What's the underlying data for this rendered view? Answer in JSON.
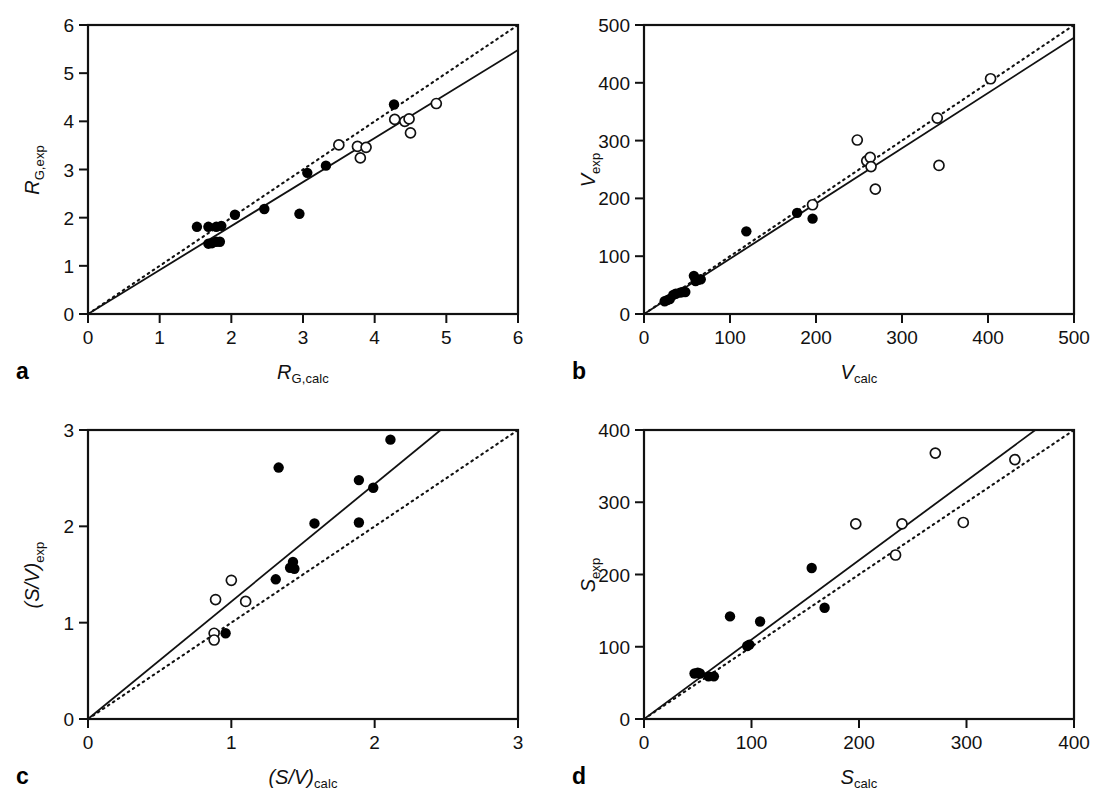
{
  "figure": {
    "background": "#ffffff",
    "marker_fill_color": "#000000",
    "marker_open_color": "#ffffff",
    "line_color": "#000000"
  },
  "panels": [
    {
      "letter": "a",
      "xlabel_main": "R",
      "xlabel_sub": "G,calc",
      "ylabel_main": "R",
      "ylabel_sub": "G,exp",
      "xticks": [
        "0",
        "1",
        "2",
        "3",
        "4",
        "5",
        "6"
      ],
      "yticks": [
        "0",
        "1",
        "2",
        "3",
        "4",
        "5",
        "6"
      ]
    },
    {
      "letter": "b",
      "xlabel_main": "V",
      "xlabel_sub": "calc",
      "ylabel_main": "V",
      "ylabel_sub": "exp",
      "xticks": [
        "0",
        "100",
        "200",
        "300",
        "400",
        "500"
      ],
      "yticks": [
        "0",
        "100",
        "200",
        "300",
        "400",
        "500"
      ]
    },
    {
      "letter": "c",
      "xlabel_main": "(S/V)",
      "xlabel_sub": "calc",
      "ylabel_main": "(S/V)",
      "ylabel_sub": "exp",
      "xticks": [
        "0",
        "1",
        "2",
        "3"
      ],
      "yticks": [
        "0",
        "1",
        "2",
        "3"
      ]
    },
    {
      "letter": "d",
      "xlabel_main": "S",
      "xlabel_sub": "calc",
      "ylabel_main": "S",
      "ylabel_sub": "exp",
      "xticks": [
        "0",
        "100",
        "200",
        "300",
        "400"
      ],
      "yticks": [
        "0",
        "100",
        "200",
        "300",
        "400"
      ]
    }
  ],
  "chart_data": [
    {
      "type": "scatter",
      "panel": "a",
      "title": "",
      "xlabel": "R_G,calc",
      "ylabel": "R_G,exp",
      "xlim": [
        0,
        6
      ],
      "ylim": [
        0,
        6
      ],
      "xticks": [
        0,
        1,
        2,
        3,
        4,
        5,
        6
      ],
      "yticks": [
        0,
        1,
        2,
        3,
        4,
        5,
        6
      ],
      "grid": false,
      "legend": "none",
      "series": [
        {
          "name": "filled-circles",
          "marker": "filled-circle",
          "points": [
            [
              1.52,
              1.81
            ],
            [
              1.68,
              1.81
            ],
            [
              1.79,
              1.81
            ],
            [
              1.86,
              1.83
            ],
            [
              1.68,
              1.46
            ],
            [
              1.73,
              1.47
            ],
            [
              1.79,
              1.5
            ],
            [
              1.84,
              1.5
            ],
            [
              2.05,
              2.06
            ],
            [
              2.46,
              2.18
            ],
            [
              2.95,
              2.08
            ],
            [
              3.06,
              2.93
            ],
            [
              3.32,
              3.08
            ],
            [
              4.27,
              4.35
            ]
          ]
        },
        {
          "name": "open-circles",
          "marker": "open-circle",
          "points": [
            [
              3.5,
              3.51
            ],
            [
              3.76,
              3.48
            ],
            [
              3.88,
              3.46
            ],
            [
              3.8,
              3.24
            ],
            [
              4.28,
              4.04
            ],
            [
              4.42,
              4.0
            ],
            [
              4.48,
              4.05
            ],
            [
              4.5,
              3.76
            ],
            [
              4.86,
              4.37
            ]
          ]
        }
      ],
      "lines": [
        {
          "name": "identity-line",
          "style": "dotted",
          "from": [
            0,
            0
          ],
          "to": [
            6,
            6
          ]
        },
        {
          "name": "regression-line",
          "style": "solid",
          "from": [
            0,
            0
          ],
          "to": [
            6,
            5.48
          ]
        }
      ]
    },
    {
      "type": "scatter",
      "panel": "b",
      "title": "",
      "xlabel": "V_calc",
      "ylabel": "V_exp",
      "xlim": [
        0,
        500
      ],
      "ylim": [
        0,
        500
      ],
      "xticks": [
        0,
        100,
        200,
        300,
        400,
        500
      ],
      "yticks": [
        0,
        100,
        200,
        300,
        400,
        500
      ],
      "grid": false,
      "legend": "none",
      "series": [
        {
          "name": "filled-circles",
          "marker": "filled-circle",
          "points": [
            [
              24,
              22
            ],
            [
              27,
              24
            ],
            [
              30,
              26
            ],
            [
              34,
              33
            ],
            [
              37,
              35
            ],
            [
              42,
              37
            ],
            [
              45,
              38
            ],
            [
              48,
              38
            ],
            [
              58,
              66
            ],
            [
              60,
              57
            ],
            [
              63,
              59
            ],
            [
              66,
              60
            ],
            [
              119,
              143
            ],
            [
              178,
              175
            ],
            [
              196,
              165
            ]
          ]
        },
        {
          "name": "open-circles",
          "marker": "open-circle",
          "points": [
            [
              196,
              189
            ],
            [
              248,
              301
            ],
            [
              259,
              265
            ],
            [
              263,
              271
            ],
            [
              264,
              255
            ],
            [
              269,
              216
            ],
            [
              341,
              339
            ],
            [
              343,
              257
            ],
            [
              403,
              407
            ]
          ]
        }
      ],
      "lines": [
        {
          "name": "identity-line",
          "style": "dotted",
          "from": [
            0,
            0
          ],
          "to": [
            500,
            500
          ]
        },
        {
          "name": "regression-line",
          "style": "solid",
          "from": [
            0,
            0
          ],
          "to": [
            500,
            478
          ]
        }
      ]
    },
    {
      "type": "scatter",
      "panel": "c",
      "title": "",
      "xlabel": "(S/V)_calc",
      "ylabel": "(S/V)_exp",
      "xlim": [
        0,
        3
      ],
      "ylim": [
        0,
        3
      ],
      "xticks": [
        0,
        1,
        2,
        3
      ],
      "yticks": [
        0,
        1,
        2,
        3
      ],
      "grid": false,
      "legend": "none",
      "series": [
        {
          "name": "filled-circles",
          "marker": "filled-circle",
          "points": [
            [
              0.96,
              0.89
            ],
            [
              1.31,
              1.45
            ],
            [
              1.41,
              1.57
            ],
            [
              1.43,
              1.63
            ],
            [
              1.44,
              1.56
            ],
            [
              1.33,
              2.61
            ],
            [
              1.58,
              2.03
            ],
            [
              1.89,
              2.04
            ],
            [
              1.89,
              2.48
            ],
            [
              1.99,
              2.4
            ],
            [
              2.11,
              2.9
            ]
          ]
        },
        {
          "name": "open-circles",
          "marker": "open-circle",
          "points": [
            [
              0.88,
              0.89
            ],
            [
              0.88,
              0.82
            ],
            [
              0.89,
              1.24
            ],
            [
              1.0,
              1.44
            ],
            [
              1.1,
              1.22
            ]
          ]
        }
      ],
      "lines": [
        {
          "name": "identity-line",
          "style": "dotted",
          "from": [
            0,
            0
          ],
          "to": [
            3,
            3
          ]
        },
        {
          "name": "regression-line",
          "style": "solid",
          "from": [
            0,
            0
          ],
          "to": [
            2.46,
            3.0
          ]
        }
      ]
    },
    {
      "type": "scatter",
      "panel": "d",
      "title": "",
      "xlabel": "S_calc",
      "ylabel": "S_exp",
      "xlim": [
        0,
        400
      ],
      "ylim": [
        0,
        400
      ],
      "xticks": [
        0,
        100,
        200,
        300,
        400
      ],
      "yticks": [
        0,
        100,
        200,
        300,
        400
      ],
      "grid": false,
      "legend": "none",
      "series": [
        {
          "name": "filled-circles",
          "marker": "filled-circle",
          "points": [
            [
              47,
              63
            ],
            [
              50,
              64
            ],
            [
              52,
              63
            ],
            [
              60,
              59
            ],
            [
              65,
              59
            ],
            [
              80,
              142
            ],
            [
              96,
              101
            ],
            [
              98,
              103
            ],
            [
              108,
              135
            ],
            [
              156,
              209
            ],
            [
              168,
              154
            ]
          ]
        },
        {
          "name": "open-circles",
          "marker": "open-circle",
          "points": [
            [
              197,
              270
            ],
            [
              234,
              227
            ],
            [
              240,
              270
            ],
            [
              271,
              368
            ],
            [
              297,
              272
            ],
            [
              345,
              359
            ]
          ]
        }
      ],
      "lines": [
        {
          "name": "identity-line",
          "style": "dotted",
          "from": [
            0,
            0
          ],
          "to": [
            400,
            400
          ]
        },
        {
          "name": "regression-line",
          "style": "solid",
          "from": [
            0,
            0
          ],
          "to": [
            364,
            400
          ]
        }
      ]
    }
  ]
}
